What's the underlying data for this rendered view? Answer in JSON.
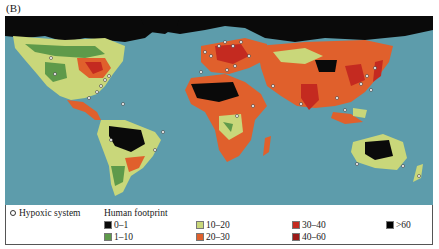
{
  "figure": {
    "panel_label": "(B)"
  },
  "map": {
    "ocean_color": "#5d9cab",
    "hypoxic_marker": "open-circle"
  },
  "legend": {
    "hypoxic_label": "Hypoxic system",
    "footprint_title": "Human footprint",
    "items": [
      {
        "label": "0–1",
        "color": "#0a0a0a"
      },
      {
        "label": "1–10",
        "color": "#5e9a4a"
      },
      {
        "label": "10–20",
        "color": "#c9d77a"
      },
      {
        "label": "20–30",
        "color": "#e0602c"
      },
      {
        "label": "30–40",
        "color": "#c42a20"
      },
      {
        "label": "40–60",
        "color": "#9c1a18"
      },
      {
        "label": ">60",
        "color": "#000000"
      }
    ]
  }
}
